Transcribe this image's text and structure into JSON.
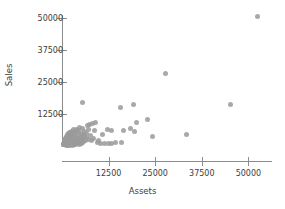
{
  "chart_data": {
    "type": "scatter",
    "title": "",
    "xlabel": "Assets",
    "ylabel": "Sales",
    "xlim": [
      0,
      56500
    ],
    "ylim": [
      0,
      54000
    ],
    "grid": false,
    "legend": false,
    "marker": {
      "color": "#9a9a9a",
      "shape": "circle",
      "size": 5
    },
    "xticks": [
      12500,
      25000,
      37500,
      50000
    ],
    "yticks": [
      12500,
      25000,
      37500,
      50000
    ],
    "xticklabels": [
      "12500",
      "25000",
      "37500",
      "50000"
    ],
    "yticklabels": [
      "12500",
      "25000",
      "37500",
      "50000"
    ],
    "axis_color": "#8c8c8c",
    "text_color": "#3d3d3d",
    "background": "#ffffff",
    "points": [
      [
        52500,
        50500
      ],
      [
        27800,
        28500
      ],
      [
        45200,
        16300
      ],
      [
        5600,
        16800
      ],
      [
        15800,
        15200
      ],
      [
        19300,
        16100
      ],
      [
        19900,
        9300
      ],
      [
        22900,
        10400
      ],
      [
        8900,
        9200
      ],
      [
        7400,
        8500
      ],
      [
        8200,
        8900
      ],
      [
        6800,
        8000
      ],
      [
        18500,
        7000
      ],
      [
        19500,
        5800
      ],
      [
        33500,
        4600
      ],
      [
        24200,
        3600
      ],
      [
        16600,
        6200
      ],
      [
        4800,
        7400
      ],
      [
        5400,
        6900
      ],
      [
        3900,
        6600
      ],
      [
        4400,
        6100
      ],
      [
        3100,
        6300
      ],
      [
        2600,
        5800
      ],
      [
        3500,
        5500
      ],
      [
        2100,
        5400
      ],
      [
        2900,
        5100
      ],
      [
        4100,
        5300
      ],
      [
        5100,
        5000
      ],
      [
        6100,
        5600
      ],
      [
        7000,
        6400
      ],
      [
        1800,
        4900
      ],
      [
        2400,
        4600
      ],
      [
        3300,
        4400
      ],
      [
        4600,
        4200
      ],
      [
        5800,
        4500
      ],
      [
        6500,
        4800
      ],
      [
        1400,
        4300
      ],
      [
        2000,
        4000
      ],
      [
        2800,
        3900
      ],
      [
        3700,
        3700
      ],
      [
        4900,
        3500
      ],
      [
        6000,
        3800
      ],
      [
        7600,
        4100
      ],
      [
        1100,
        3600
      ],
      [
        1700,
        3400
      ],
      [
        2300,
        3200
      ],
      [
        3100,
        3100
      ],
      [
        4200,
        2900
      ],
      [
        5300,
        3000
      ],
      [
        6700,
        3300
      ],
      [
        900,
        3000
      ],
      [
        1500,
        2800
      ],
      [
        2100,
        2600
      ],
      [
        2700,
        2500
      ],
      [
        3500,
        2400
      ],
      [
        4500,
        2300
      ],
      [
        5600,
        2600
      ],
      [
        7200,
        2700
      ],
      [
        800,
        2400
      ],
      [
        1300,
        2200
      ],
      [
        1900,
        2100
      ],
      [
        2500,
        2000
      ],
      [
        3200,
        1900
      ],
      [
        4000,
        1800
      ],
      [
        5000,
        2000
      ],
      [
        6200,
        2200
      ],
      [
        700,
        1900
      ],
      [
        1200,
        1700
      ],
      [
        1800,
        1600
      ],
      [
        2400,
        1500
      ],
      [
        3000,
        1400
      ],
      [
        3800,
        1300
      ],
      [
        4700,
        1500
      ],
      [
        5900,
        1600
      ],
      [
        600,
        1400
      ],
      [
        1000,
        1300
      ],
      [
        1600,
        1200
      ],
      [
        2200,
        1100
      ],
      [
        2900,
        1000
      ],
      [
        3600,
        1100
      ],
      [
        4400,
        1200
      ],
      [
        5500,
        1300
      ],
      [
        500,
        1000
      ],
      [
        900,
        900
      ],
      [
        1400,
        800
      ],
      [
        2000,
        750
      ],
      [
        2600,
        700
      ],
      [
        3300,
        800
      ],
      [
        4100,
        900
      ],
      [
        5200,
        1000
      ],
      [
        400,
        700
      ],
      [
        800,
        600
      ],
      [
        1200,
        550
      ],
      [
        1700,
        500
      ],
      [
        2300,
        480
      ],
      [
        3000,
        520
      ],
      [
        3700,
        600
      ],
      [
        4800,
        700
      ],
      [
        350,
        450
      ],
      [
        700,
        400
      ],
      [
        1100,
        380
      ],
      [
        1500,
        350
      ],
      [
        2100,
        330
      ],
      [
        2700,
        360
      ],
      [
        3400,
        420
      ],
      [
        10300,
        1100
      ],
      [
        11400,
        1050
      ],
      [
        12400,
        1000
      ],
      [
        13400,
        1100
      ],
      [
        14400,
        1200
      ],
      [
        16000,
        1300
      ],
      [
        9400,
        1500
      ],
      [
        10900,
        4300
      ],
      [
        12100,
        6400
      ],
      [
        13300,
        5900
      ],
      [
        8600,
        6000
      ],
      [
        9900,
        2100
      ],
      [
        7900,
        2000
      ],
      [
        8400,
        3000
      ]
    ]
  }
}
